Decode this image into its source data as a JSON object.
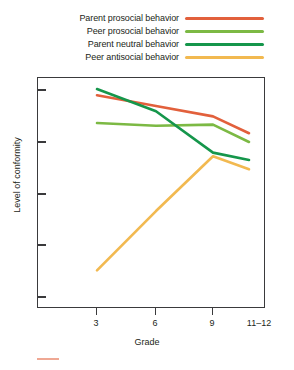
{
  "chart_data": {
    "type": "line",
    "title": "",
    "xlabel": "Grade",
    "ylabel": "Level of conformity",
    "categories": [
      "3",
      "6",
      "9",
      "11–12"
    ],
    "grid": false,
    "legend_position": "top",
    "xlim": [
      0,
      3
    ],
    "ylim": [
      0,
      1
    ],
    "y_tick_count": 5,
    "y_tick_labels": [],
    "series": [
      {
        "name": "Parent prosocial behavior",
        "color": "#e2603c",
        "values": [
          0.925,
          0.879,
          0.834,
          0.761
        ]
      },
      {
        "name": "Peer prosocial behavior",
        "color": "#7cb944",
        "values": [
          0.805,
          0.793,
          0.798,
          0.723
        ]
      },
      {
        "name": "Parent neutral behavior",
        "color": "#15964b",
        "values": [
          0.952,
          0.856,
          0.677,
          0.645
        ]
      },
      {
        "name": "Peer antisocial behavior",
        "color": "#f2b950",
        "values": [
          0.167,
          0.424,
          0.661,
          0.605
        ]
      }
    ]
  },
  "legend": {
    "items": [
      {
        "label": "Parent prosocial behavior",
        "color": "#e2603c"
      },
      {
        "label": "Peer prosocial behavior",
        "color": "#7cb944"
      },
      {
        "label": "Parent neutral behavior",
        "color": "#15964b"
      },
      {
        "label": "Peer antisocial behavior",
        "color": "#f2b950"
      }
    ]
  },
  "axes": {
    "x_title": "Grade",
    "y_title": "Level of conformity",
    "x_tick_labels": [
      "3",
      "6",
      "9",
      "11–12"
    ]
  },
  "colors": {
    "axis": "#3a3a3c",
    "text": "#231f20",
    "background": "#ffffff"
  }
}
